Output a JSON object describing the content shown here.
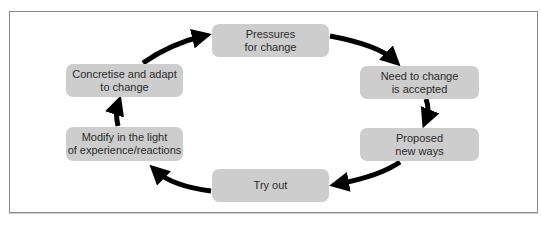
{
  "diagram": {
    "type": "cycle",
    "nodes": [
      {
        "id": "pressures",
        "label": "Pressures\nfor change"
      },
      {
        "id": "need",
        "label": "Need to change\nis accepted"
      },
      {
        "id": "proposed",
        "label": "Proposed\nnew ways"
      },
      {
        "id": "tryout",
        "label": "Try out"
      },
      {
        "id": "modify",
        "label": "Modify in the light\nof experience/reactions"
      },
      {
        "id": "concretise",
        "label": "Concretise and adapt\nto change"
      }
    ],
    "edges": [
      {
        "from": "pressures",
        "to": "need"
      },
      {
        "from": "need",
        "to": "proposed"
      },
      {
        "from": "proposed",
        "to": "tryout"
      },
      {
        "from": "tryout",
        "to": "modify"
      },
      {
        "from": "modify",
        "to": "concretise"
      },
      {
        "from": "concretise",
        "to": "pressures"
      }
    ],
    "colors": {
      "node_fill": "#cdcdcd",
      "arrow": "#000000",
      "frame_border": "#8a8a8a",
      "text": "#2b2b2b"
    }
  }
}
